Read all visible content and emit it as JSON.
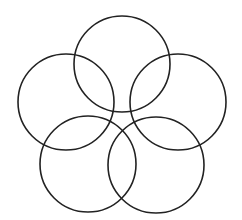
{
  "diagram": {
    "type": "overlapping-circles",
    "stroke_color": "#222222",
    "background": "#ffffff",
    "circles": [
      {
        "name": "top",
        "cx": 122,
        "cy": 64,
        "r": 48
      },
      {
        "name": "left",
        "cx": 66,
        "cy": 102,
        "r": 48
      },
      {
        "name": "right",
        "cx": 178,
        "cy": 102,
        "r": 48
      },
      {
        "name": "bottom-left",
        "cx": 88,
        "cy": 164,
        "r": 48
      },
      {
        "name": "bottom-right",
        "cx": 156,
        "cy": 165,
        "r": 48
      }
    ]
  }
}
